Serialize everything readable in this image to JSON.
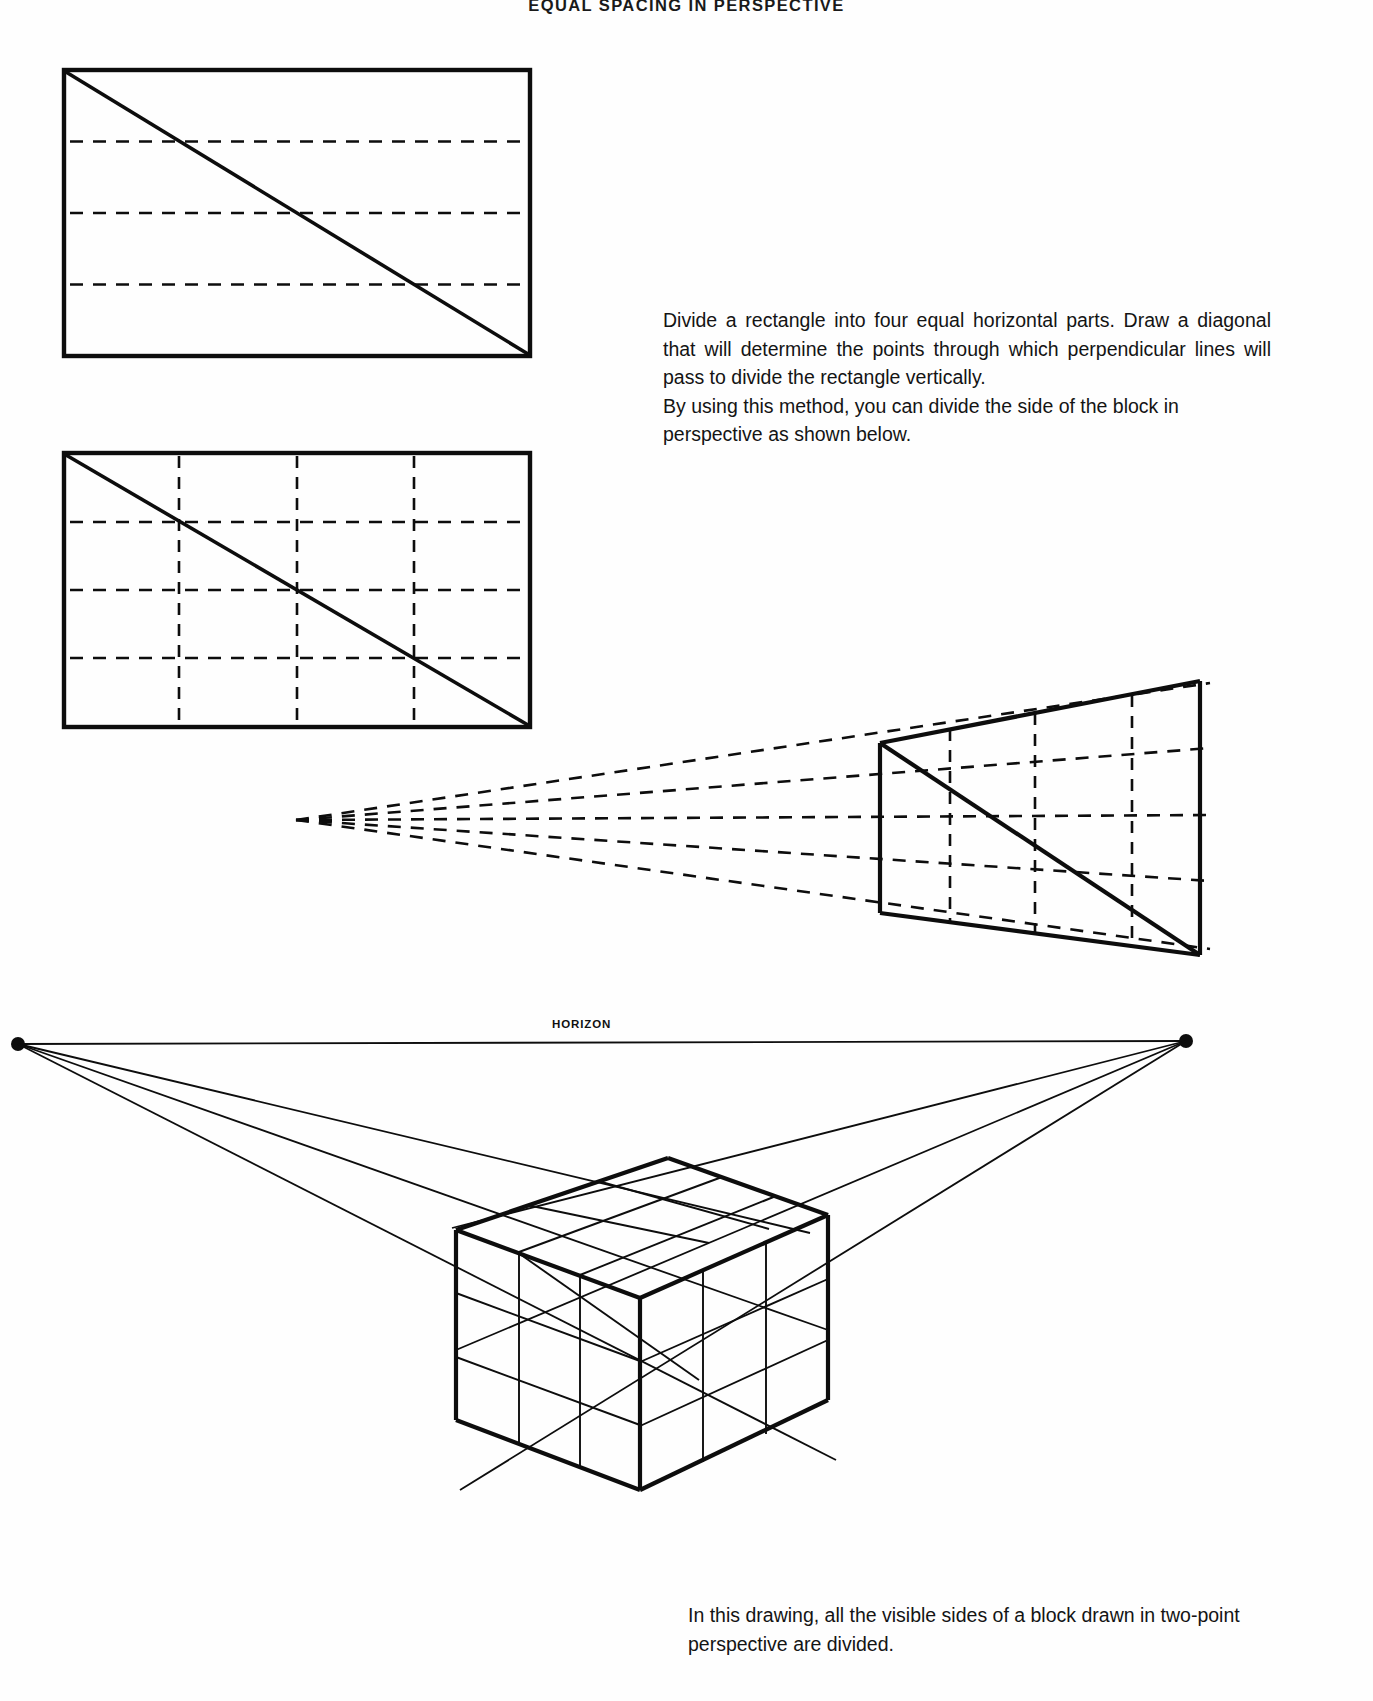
{
  "page": {
    "header_number": "EQUAL",
    "header_title": "SPACING IN PERSPECTIVE",
    "header_full": "EQUAL SPACING IN PERSPECTIVE",
    "background_color": "#ffffff",
    "ink_color": "#0d0d0d"
  },
  "intro_text": {
    "paragraph_1": "Divide a rectangle into four equal horizontal parts. Draw a diagonal that will determine the points through which perpendicular lines will pass to divide the rectangle vertically.",
    "paragraph_2": "By using this method, you can divide the side of the block in perspective as shown below."
  },
  "bottom_caption": {
    "text": "In this drawing, all the visible sides of a block drawn in two-point perspective are divided."
  },
  "labels": {
    "horizon": "HORIZON"
  },
  "figures": {
    "figure_1": {
      "name": "rectangle-horizontal-divisions",
      "description": "Rectangle divided into four equal horizontal parts with a diagonal",
      "horizontal_divisions": 4,
      "vertical_divisions": 1,
      "has_diagonal": true,
      "diagonal_from": "top-left",
      "diagonal_to": "bottom-right",
      "border_style": "solid",
      "division_style": "dashed"
    },
    "figure_2": {
      "name": "rectangle-full-grid",
      "description": "Rectangle divided into four horizontal and four vertical parts with a diagonal",
      "horizontal_divisions": 4,
      "vertical_divisions": 4,
      "has_diagonal": true,
      "diagonal_from": "top-left",
      "diagonal_to": "bottom-right",
      "border_style": "solid",
      "division_style": "dashed"
    },
    "figure_3": {
      "name": "perspective-plane-divided",
      "description": "Quadrilateral plane in perspective divided into a 4 by 4 grid with dashed lines converging to a vanishing point at the left",
      "horizontal_divisions": 4,
      "vertical_divisions": 4,
      "has_diagonal": true,
      "has_vanishing_point": true,
      "vanishing_point_side": "left",
      "border_style": "solid",
      "division_style": "dashed"
    },
    "figure_4": {
      "name": "two-point-perspective-block",
      "description": "Cube block in two-point perspective with all visible faces divided into a 3 by 3 grid, horizon line with two vanishing points",
      "grid_per_face": "3 x 3",
      "vanishing_points": 2,
      "has_horizon_line": true,
      "border_style": "solid"
    }
  }
}
